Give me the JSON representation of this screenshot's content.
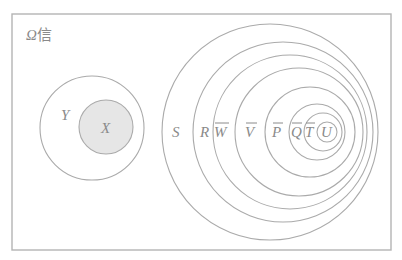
{
  "diagram": {
    "title": {
      "symbol": "Ω",
      "text": "信"
    },
    "colors": {
      "stroke": "#aaaaaa",
      "frame": "#b4b4b4",
      "fill_X": "#e6e6e6",
      "text": "#8a8a8a"
    },
    "left_group": {
      "outer": {
        "label": "Y",
        "cx": 92,
        "cy": 128,
        "r": 52
      },
      "inner": {
        "label": "X",
        "cx": 106,
        "cy": 127,
        "r": 27,
        "filled": true
      }
    },
    "right_group": {
      "circles": [
        {
          "label": "S",
          "overline": false
        },
        {
          "label": "R",
          "overline": false
        },
        {
          "label": "W",
          "overline": true
        },
        {
          "label": "V",
          "overline": true
        },
        {
          "label": "P",
          "overline": true
        },
        {
          "label": "Q",
          "overline": true
        },
        {
          "label": "T",
          "overline": true
        },
        {
          "label": "U",
          "overline": false
        }
      ]
    }
  }
}
